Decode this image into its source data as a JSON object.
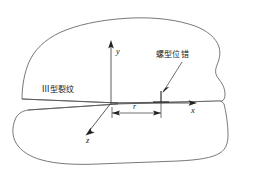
{
  "figure": {
    "axes": {
      "y_label": "y",
      "x_label": "x",
      "z_label": "z"
    },
    "annotations": {
      "crack_label": "III型裂纹",
      "dislocation_label": "螺型位错",
      "radius_label": "r"
    },
    "symbols": {
      "dislocation_glyph": "perpendicular-tack-icon",
      "x_axis_arrow": "arrow-right-icon",
      "y_axis_arrow": "arrow-up-icon",
      "z_axis_arrow": "arrow-down-left-icon",
      "leader_arrow": "arrow-pointer-icon",
      "dimension_arrows": "double-headed-arrow-icon"
    },
    "colors": {
      "outline": "#555555",
      "axis": "#333333",
      "text": "#1a1a1a",
      "background": "#ffffff"
    }
  }
}
